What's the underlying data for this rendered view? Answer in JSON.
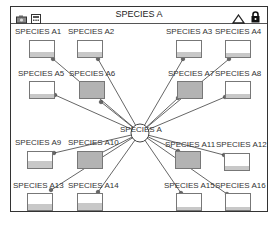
{
  "window": {
    "title": "SPECIES A"
  },
  "toolbar": {
    "left_icons": [
      "camera-icon",
      "calculator-icon"
    ],
    "right_icons": [
      "triangle-up-icon",
      "lock-icon"
    ]
  },
  "center_node": {
    "label": "SPECIES A",
    "x": 140,
    "y": 133,
    "r": 9
  },
  "colors": {
    "line": "#555555",
    "node": "#666666",
    "box_border": "#777777",
    "box_fill_dark": "#b3b3b3",
    "box_fill_level": "#c8c8c8"
  },
  "nodes": [
    {
      "label": "SPECIES A1",
      "lx": 15,
      "ly": 27,
      "bx": 29,
      "by": 40,
      "dark": false,
      "fill": 5,
      "px": 53,
      "py": 59
    },
    {
      "label": "SPECIES A2",
      "lx": 68,
      "ly": 27,
      "bx": 77,
      "by": 40,
      "dark": false,
      "fill": 5,
      "px": 98,
      "py": 59
    },
    {
      "label": "SPECIES A3",
      "lx": 166,
      "ly": 27,
      "bx": 176,
      "by": 40,
      "dark": false,
      "fill": 5,
      "px": 183,
      "py": 59
    },
    {
      "label": "SPECIES A4",
      "lx": 215,
      "ly": 27,
      "bx": 225,
      "by": 40,
      "dark": false,
      "fill": 4,
      "px": 229,
      "py": 59
    },
    {
      "label": "SPECIES A5",
      "lx": 18,
      "ly": 69,
      "bx": 29,
      "by": 81,
      "dark": false,
      "fill": 4,
      "px": 55,
      "py": 95
    },
    {
      "label": "SPECIES A6",
      "lx": 69,
      "ly": 69,
      "bx": 79,
      "by": 81,
      "dark": true,
      "fill": 0,
      "px": 101,
      "py": 102
    },
    {
      "label": "SPECIES A7",
      "lx": 168,
      "ly": 69,
      "bx": 177,
      "by": 81,
      "dark": true,
      "fill": 0,
      "px": 178,
      "py": 98
    },
    {
      "label": "SPECIES A8",
      "lx": 215,
      "ly": 69,
      "bx": 225,
      "by": 81,
      "dark": false,
      "fill": 4,
      "px": 225,
      "py": 97
    },
    {
      "label": "SPECIES A9",
      "lx": 15,
      "ly": 138,
      "bx": 27,
      "by": 151,
      "dark": false,
      "fill": 7,
      "px": 54,
      "py": 153
    },
    {
      "label": "SPECIES A10",
      "lx": 68,
      "ly": 138,
      "bx": 77,
      "by": 151,
      "dark": true,
      "fill": 0,
      "px": 99,
      "py": 154
    },
    {
      "label": "SPECIES A11",
      "lx": 165,
      "ly": 140,
      "bx": 175,
      "by": 151,
      "dark": true,
      "fill": 0,
      "px": 178,
      "py": 151
    },
    {
      "label": "SPECIES A12",
      "lx": 216,
      "ly": 140,
      "bx": 224,
      "by": 153,
      "dark": false,
      "fill": 4,
      "px": 224,
      "py": 155
    },
    {
      "label": "SPECIES A13",
      "lx": 13,
      "ly": 181,
      "bx": 27,
      "by": 193,
      "dark": false,
      "fill": 6,
      "px": 51,
      "py": 190
    },
    {
      "label": "SPECIES A14",
      "lx": 68,
      "ly": 181,
      "bx": 77,
      "by": 193,
      "dark": false,
      "fill": 7,
      "px": 98,
      "py": 192
    },
    {
      "label": "SPECIES A15",
      "lx": 164,
      "ly": 181,
      "bx": 176,
      "by": 193,
      "dark": false,
      "fill": 3,
      "px": 181,
      "py": 193
    },
    {
      "label": "SPECIES A16",
      "lx": 215,
      "ly": 181,
      "bx": 225,
      "by": 193,
      "dark": false,
      "fill": 3,
      "px": 227,
      "py": 194
    }
  ]
}
